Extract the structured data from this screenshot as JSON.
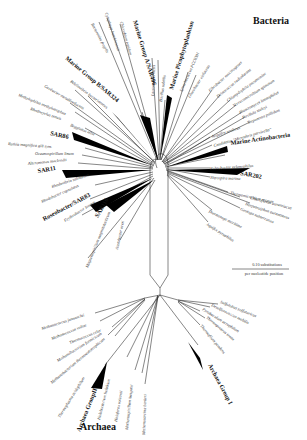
{
  "domains": {
    "bacteria": "Bacteria",
    "archaea": "Archaea"
  },
  "scale_bar": {
    "line1": "0.10 substitutions",
    "line2": "per nucleotide position"
  },
  "colors": {
    "line": "#222222",
    "wedge": "#000000",
    "text": "#333333"
  },
  "bacteria_groups": [
    {
      "id": "marine-group-a",
      "label": "Marine Group A/SAR406"
    },
    {
      "id": "marine-group-b",
      "label": "Marine Group B/SAR324"
    },
    {
      "id": "marine-picophytoplankton",
      "label": "Marine Picophytoplankton"
    },
    {
      "id": "sar86",
      "label": "SAR86"
    },
    {
      "id": "sar11",
      "label": "SAR11"
    },
    {
      "id": "roseobacter",
      "label": "Roseobacter/SAR83"
    },
    {
      "id": "sar116",
      "label": "SAR116"
    },
    {
      "id": "marine-actinobacteria",
      "label": "Marine Actinobacteria"
    },
    {
      "id": "sar202",
      "label": "SAR202"
    }
  ],
  "bacteria_taxa": [
    "Bacteroides fragilis",
    "Cytophaga hutchinsonii",
    "Chlorobium tepidum",
    "Lactococcus lactis",
    "Bacillus subtilis",
    "Synechococcus PCC6301",
    "Gloeobacter violaceus",
    "Fibrobacter succinogenes",
    "Deinococcus radiodurans",
    "Chlamydophila pneumoniae",
    "Verrucomicrobium spinosum",
    "Planctomyces limnophilus",
    "Pirellula staleyi",
    "Treponema pallidum",
    "Acquifex aeolicus",
    "Candidatus \"Microthrix parvicella\"",
    "Rubrobacter xylanophilus",
    "Nitrospira marina",
    "Thermomicrobium roseum",
    "Chloroflexus aurantiacus",
    "Herpetosiphon aurantiacus",
    "Geotoga subterranea",
    "Thermotoga maritima",
    "Aquifex pyrophilus",
    "Bdellovibrio bacteriovorus",
    "Geobacter metallireducens",
    "Methylophilus methylotrophus",
    "Rhodocyclus tenuis",
    "Beggiatoa alba",
    "Ruthia magnifica gill sym.",
    "Oceanospirillum linum",
    "Alteromonas macleodii",
    "Rhodovibrio salinarum",
    "Rhodobacter capsulatus",
    "Erythrobacter longus",
    "Magnetospirillum magnetotacticum",
    "Acetobacter aceti"
  ],
  "archaea_groups": [
    {
      "id": "archaea-group-i",
      "label": "Archaea Group I"
    },
    {
      "id": "archaea-group-ii",
      "label": "Archaea GroupII"
    }
  ],
  "archaea_taxa": [
    "Sulfolobus solfataricus",
    "Desulfurococcus mobilis",
    "Pyrobaculum aerophilum",
    "Thermoproteus tenax",
    "Thermofilum pendens",
    "Methanococcus jannaschii",
    "Methanococcus voltae",
    "Thermococcus celer",
    "Methanobacterium formicicum",
    "Methanobacterium thermoautotrophicum",
    "Thermoplasma acidophilum",
    "Halobacterium halobium",
    "Haloferax volcanii",
    "Methanospirillum hungatei",
    "Methanosarcina barkeri"
  ]
}
